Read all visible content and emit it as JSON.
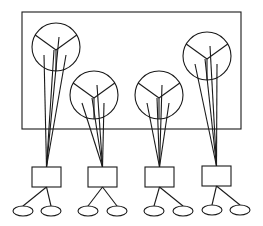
{
  "diagram": {
    "type": "hierarchy",
    "stroke_color": "#1a1a1a",
    "background": "#ffffff",
    "container": {
      "x": 22,
      "y": 12,
      "width": 219,
      "height": 117
    },
    "units": [
      {
        "id": "unit-1",
        "circle": {
          "cx": 56,
          "cy": 47,
          "r": 24
        },
        "box": {
          "x": 32,
          "y": 167,
          "width": 29,
          "height": 20
        },
        "ovals": [
          {
            "cx": 23,
            "cy": 211,
            "rx": 10,
            "ry": 5
          },
          {
            "cx": 51,
            "cy": 211,
            "rx": 10,
            "ry": 5
          }
        ]
      },
      {
        "id": "unit-2",
        "circle": {
          "cx": 94,
          "cy": 95,
          "r": 24
        },
        "box": {
          "x": 88,
          "y": 167,
          "width": 29,
          "height": 20
        },
        "ovals": [
          {
            "cx": 88,
            "cy": 211,
            "rx": 10,
            "ry": 5
          },
          {
            "cx": 117,
            "cy": 211,
            "rx": 10,
            "ry": 5
          }
        ]
      },
      {
        "id": "unit-3",
        "circle": {
          "cx": 159,
          "cy": 95,
          "r": 24
        },
        "box": {
          "x": 145,
          "y": 167,
          "width": 29,
          "height": 20
        },
        "ovals": [
          {
            "cx": 154,
            "cy": 211,
            "rx": 10,
            "ry": 5
          },
          {
            "cx": 183,
            "cy": 211,
            "rx": 10,
            "ry": 5
          }
        ]
      },
      {
        "id": "unit-4",
        "circle": {
          "cx": 207,
          "cy": 56,
          "r": 24
        },
        "box": {
          "x": 202,
          "y": 166,
          "width": 29,
          "height": 20
        },
        "ovals": [
          {
            "cx": 212,
            "cy": 210,
            "rx": 10,
            "ry": 5
          },
          {
            "cx": 240,
            "cy": 210,
            "rx": 10,
            "ry": 5
          }
        ]
      }
    ]
  }
}
